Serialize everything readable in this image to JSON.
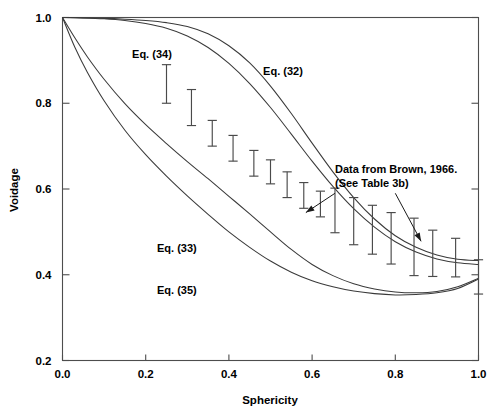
{
  "chart_data": {
    "type": "line",
    "title": "",
    "xlabel": "Sphericity",
    "ylabel": "Voidage",
    "xlim": [
      0.0,
      1.0
    ],
    "ylim": [
      0.2,
      1.0
    ],
    "xticks": [
      0.0,
      0.2,
      0.4,
      0.6,
      0.8,
      1.0
    ],
    "yticks": [
      0.2,
      0.4,
      0.6,
      0.8,
      1.0
    ],
    "xtick_labels": [
      "0.0",
      "0.2",
      "0.4",
      "0.6",
      "0.8",
      "1.0"
    ],
    "ytick_labels": [
      "0.2",
      "0.4",
      "0.6",
      "0.8",
      "1.0"
    ],
    "grid": false,
    "legend_position": "inline-annotations",
    "series": [
      {
        "name": "Eq. (32)",
        "label": "Eq. (32)",
        "label_x": 0.53,
        "label_y": 0.875,
        "x": [
          0.0,
          0.05,
          0.1,
          0.15,
          0.2,
          0.25,
          0.3,
          0.35,
          0.4,
          0.45,
          0.5,
          0.55,
          0.6,
          0.65,
          0.7,
          0.75,
          0.8,
          0.85,
          0.9,
          0.95,
          1.0
        ],
        "y": [
          1.0,
          0.999,
          0.998,
          0.996,
          0.993,
          0.988,
          0.979,
          0.962,
          0.934,
          0.894,
          0.84,
          0.776,
          0.707,
          0.64,
          0.58,
          0.53,
          0.491,
          0.464,
          0.446,
          0.436,
          0.433
        ]
      },
      {
        "name": "Eq. (34)",
        "label": "Eq. (34)",
        "label_x": 0.215,
        "label_y": 0.915,
        "x": [
          0.0,
          0.05,
          0.1,
          0.15,
          0.2,
          0.25,
          0.3,
          0.35,
          0.4,
          0.45,
          0.5,
          0.55,
          0.6,
          0.65,
          0.7,
          0.75,
          0.8,
          0.85,
          0.9,
          0.95,
          1.0
        ],
        "y": [
          1.0,
          0.999,
          0.997,
          0.993,
          0.986,
          0.975,
          0.957,
          0.93,
          0.893,
          0.846,
          0.79,
          0.728,
          0.665,
          0.606,
          0.554,
          0.511,
          0.477,
          0.453,
          0.437,
          0.428,
          0.424
        ]
      },
      {
        "name": "Eq. (33)",
        "label": "Eq. (33)",
        "label_x": 0.275,
        "label_y": 0.462,
        "x": [
          0.0,
          0.03,
          0.06,
          0.1,
          0.15,
          0.2,
          0.25,
          0.3,
          0.35,
          0.4,
          0.45,
          0.5,
          0.55,
          0.6,
          0.65,
          0.7,
          0.75,
          0.8,
          0.85,
          0.9,
          0.95,
          1.0
        ],
        "y": [
          1.0,
          0.952,
          0.908,
          0.856,
          0.799,
          0.75,
          0.706,
          0.664,
          0.624,
          0.583,
          0.542,
          0.5,
          0.459,
          0.424,
          0.398,
          0.379,
          0.367,
          0.36,
          0.358,
          0.361,
          0.372,
          0.392
        ]
      },
      {
        "name": "Eq. (35)",
        "label": "Eq. (35)",
        "label_x": 0.275,
        "label_y": 0.365,
        "x": [
          0.0,
          0.03,
          0.06,
          0.1,
          0.15,
          0.2,
          0.25,
          0.3,
          0.35,
          0.4,
          0.45,
          0.5,
          0.55,
          0.6,
          0.65,
          0.7,
          0.75,
          0.8,
          0.85,
          0.9,
          0.95,
          1.0
        ],
        "y": [
          1.0,
          0.93,
          0.872,
          0.806,
          0.737,
          0.68,
          0.63,
          0.584,
          0.541,
          0.5,
          0.464,
          0.432,
          0.406,
          0.386,
          0.372,
          0.362,
          0.356,
          0.353,
          0.354,
          0.358,
          0.368,
          0.39
        ]
      }
    ],
    "error_bars": {
      "name": "Data from Brown, 1966",
      "x": [
        0.25,
        0.31,
        0.36,
        0.41,
        0.46,
        0.5,
        0.54,
        0.58,
        0.62,
        0.655,
        0.7,
        0.745,
        0.79,
        0.845,
        0.89,
        0.945,
        1.0
      ],
      "y": [
        0.845,
        0.79,
        0.73,
        0.695,
        0.66,
        0.64,
        0.61,
        0.585,
        0.565,
        0.55,
        0.525,
        0.505,
        0.485,
        0.465,
        0.45,
        0.44,
        0.395
      ],
      "lower": [
        0.8,
        0.748,
        0.7,
        0.665,
        0.63,
        0.612,
        0.58,
        0.555,
        0.535,
        0.498,
        0.47,
        0.448,
        0.425,
        0.398,
        0.396,
        0.395,
        0.355
      ],
      "upper": [
        0.89,
        0.832,
        0.76,
        0.725,
        0.69,
        0.668,
        0.64,
        0.615,
        0.595,
        0.602,
        0.58,
        0.562,
        0.545,
        0.532,
        0.504,
        0.485,
        0.435
      ]
    },
    "annotations": [
      {
        "text_line_1": "Data from Brown, 1966.",
        "text_line_2": "(See Table 3b)",
        "text_x": 0.655,
        "text_y": 0.638,
        "arrows": [
          {
            "from_x": 0.655,
            "from_y": 0.59,
            "to_x": 0.585,
            "to_y": 0.545
          },
          {
            "from_x": 0.8,
            "from_y": 0.59,
            "to_x": 0.862,
            "to_y": 0.478
          }
        ]
      }
    ]
  },
  "axes": {
    "y_title": "Voidage",
    "x_title": "Sphericity"
  },
  "colors": {
    "curve": "#3a3a3a",
    "error_bar": "#4a4a4a",
    "frame": "#4d4d4d",
    "text": "#000000",
    "background": "#ffffff"
  }
}
